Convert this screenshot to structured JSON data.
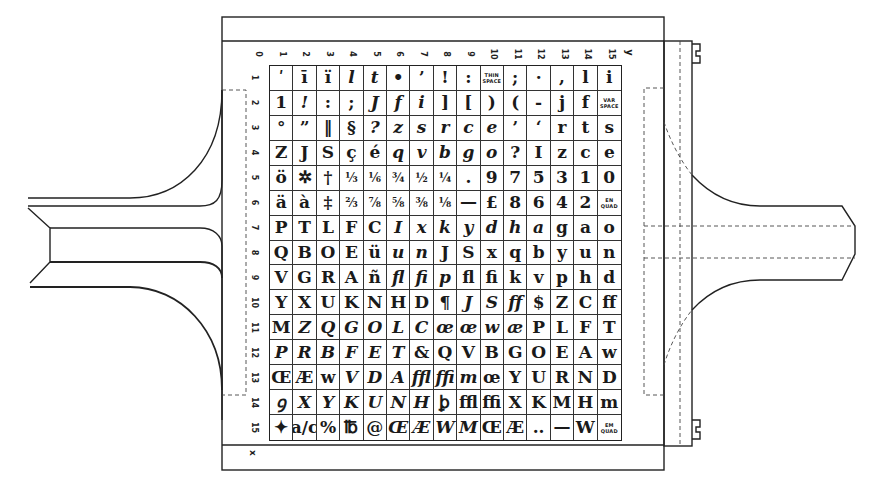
{
  "diagram": {
    "title": "",
    "axis_labels": {
      "x": "y",
      "y": "x"
    },
    "column_indices": [
      "0",
      "1",
      "2",
      "3",
      "4",
      "5",
      "6",
      "7",
      "8",
      "9",
      "10",
      "11",
      "12",
      "13",
      "14",
      "15"
    ],
    "row_indices": [
      "1",
      "2",
      "3",
      "4",
      "5",
      "6",
      "7",
      "8",
      "9",
      "10",
      "11",
      "12",
      "13",
      "14",
      "15"
    ],
    "rows": [
      [
        "ʹ",
        "ī",
        "ï",
        "l",
        "t",
        "•",
        "’",
        "!",
        ":",
        "THIN SPACE",
        ";",
        "·",
        ",",
        "l",
        "i"
      ],
      [
        "1",
        "!",
        ":",
        ";",
        "J",
        "f",
        "i",
        "]",
        "[",
        ")",
        "(",
        "-",
        "j",
        "f",
        "VAR SPACE"
      ],
      [
        "°",
        "”",
        "‖",
        "§",
        "?",
        "z",
        "s",
        "r",
        "c",
        "e",
        "’",
        "‘",
        "r",
        "t",
        "s"
      ],
      [
        "Z",
        "J",
        "S",
        "ç",
        "é",
        "q",
        "v",
        "b",
        "g",
        "o",
        "?",
        "I",
        "z",
        "c",
        "e"
      ],
      [
        "ö",
        "✲",
        "†",
        "⅓",
        "⅙",
        "¾",
        "½",
        "¼",
        ".",
        "9",
        "7",
        "5",
        "3",
        "1",
        "0"
      ],
      [
        "ä",
        "à",
        "‡",
        "⅔",
        "⅞",
        "⅝",
        "⅜",
        "⅛",
        "—",
        "£",
        "8",
        "6",
        "4",
        "2",
        "EN QUAD"
      ],
      [
        "P",
        "T",
        "L",
        "F",
        "C",
        "I",
        "x",
        "k",
        "y",
        "d",
        "h",
        "a",
        "g",
        "a",
        "o"
      ],
      [
        "Q",
        "B",
        "O",
        "E",
        "ü",
        "u",
        "n",
        "J",
        "S",
        "x",
        "q",
        "b",
        "y",
        "u",
        "n"
      ],
      [
        "V",
        "G",
        "R",
        "A",
        "ñ",
        "ﬂ",
        "ﬁ",
        "p",
        "ﬂ",
        "ﬁ",
        "k",
        "v",
        "p",
        "h",
        "d"
      ],
      [
        "Y",
        "X",
        "U",
        "K",
        "N",
        "H",
        "D",
        "¶",
        "J",
        "S",
        "ﬀ",
        "$",
        "Z",
        "C",
        "ﬀ"
      ],
      [
        "M",
        "Z",
        "Q",
        "G",
        "O",
        "L",
        "C",
        "œ",
        "œ",
        "w",
        "æ",
        "P",
        "L",
        "F",
        "T"
      ],
      [
        "P",
        "R",
        "B",
        "F",
        "E",
        "T",
        "&",
        "Q",
        "V",
        "B",
        "G",
        "O",
        "E",
        "A",
        "w"
      ],
      [
        "Œ",
        "Æ",
        "w",
        "V",
        "D",
        "A",
        "ﬄ",
        "ﬃ",
        "m",
        "œ",
        "Y",
        "U",
        "R",
        "N",
        "D"
      ],
      [
        "ꝯ",
        "X",
        "Y",
        "K",
        "U",
        "N",
        "H",
        "ꝧ",
        "ﬄ",
        "ﬃ",
        "X",
        "K",
        "M",
        "H",
        "m"
      ],
      [
        "✦",
        "a/c",
        "%",
        "℔",
        "@",
        "Œ",
        "Æ",
        "W",
        "M",
        "Œ",
        "Æ",
        "..",
        "—",
        "W",
        "EM QUAD"
      ]
    ],
    "italic_cells": [
      [
        0,
        3
      ],
      [
        0,
        4
      ],
      [
        1,
        1
      ],
      [
        1,
        4
      ],
      [
        1,
        5
      ],
      [
        1,
        6
      ],
      [
        2,
        4
      ],
      [
        2,
        5
      ],
      [
        2,
        6
      ],
      [
        2,
        7
      ],
      [
        2,
        8
      ],
      [
        2,
        9
      ],
      [
        3,
        5
      ],
      [
        3,
        6
      ],
      [
        3,
        7
      ],
      [
        3,
        8
      ],
      [
        3,
        9
      ],
      [
        6,
        5
      ],
      [
        6,
        6
      ],
      [
        6,
        7
      ],
      [
        6,
        8
      ],
      [
        6,
        9
      ],
      [
        6,
        10
      ],
      [
        6,
        11
      ],
      [
        7,
        5
      ],
      [
        7,
        6
      ],
      [
        8,
        5
      ],
      [
        8,
        6
      ],
      [
        8,
        7
      ],
      [
        9,
        8
      ],
      [
        9,
        9
      ],
      [
        9,
        10
      ],
      [
        10,
        1
      ],
      [
        10,
        2
      ],
      [
        10,
        3
      ],
      [
        10,
        4
      ],
      [
        10,
        5
      ],
      [
        10,
        6
      ],
      [
        10,
        7
      ],
      [
        10,
        8
      ],
      [
        10,
        9
      ],
      [
        10,
        10
      ],
      [
        11,
        0
      ],
      [
        11,
        1
      ],
      [
        11,
        2
      ],
      [
        11,
        3
      ],
      [
        11,
        4
      ],
      [
        11,
        5
      ],
      [
        12,
        3
      ],
      [
        12,
        4
      ],
      [
        12,
        5
      ],
      [
        12,
        6
      ],
      [
        12,
        7
      ],
      [
        12,
        8
      ],
      [
        13,
        0
      ],
      [
        13,
        1
      ],
      [
        13,
        2
      ],
      [
        13,
        3
      ],
      [
        13,
        4
      ],
      [
        13,
        5
      ],
      [
        13,
        6
      ],
      [
        14,
        5
      ],
      [
        14,
        6
      ],
      [
        14,
        7
      ],
      [
        14,
        8
      ]
    ],
    "tiny_cells": [
      [
        0,
        9
      ],
      [
        1,
        14
      ],
      [
        5,
        14
      ],
      [
        14,
        14
      ]
    ],
    "line_color": "#222222",
    "background": "#ffffff"
  }
}
